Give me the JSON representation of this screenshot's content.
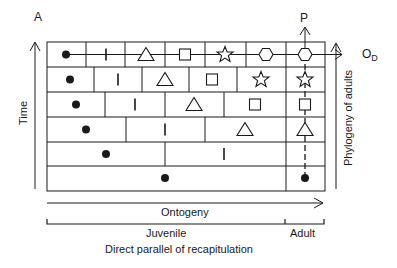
{
  "diagram": {
    "title": "Direct parallel of recapitulation",
    "labels": {
      "corner": "A",
      "time_axis": "Time",
      "phylogeny_axis": "Phylogeny of adults",
      "phylogeny_top": "P",
      "descendant_ontogeny": "O",
      "descendant_subscript": "D",
      "ontogeny_axis": "Ontogeny",
      "juvenile": "Juvenile",
      "adult": "Adult",
      "caption": "Direct parallel of recapitulation"
    },
    "colors": {
      "line": "#1a1a1a",
      "background": "#ffffff"
    },
    "rows": [
      {
        "index": 1,
        "stages": [
          "dot",
          "bar",
          "triangle",
          "square",
          "star",
          "hexagon",
          "hexagon"
        ],
        "note": "descendant ontogeny (top)"
      },
      {
        "index": 2,
        "stages": [
          "dot",
          "bar",
          "triangle",
          "square",
          "star",
          "star"
        ]
      },
      {
        "index": 3,
        "stages": [
          "dot",
          "bar",
          "triangle",
          "square",
          "square"
        ]
      },
      {
        "index": 4,
        "stages": [
          "dot",
          "bar",
          "triangle",
          "triangle"
        ]
      },
      {
        "index": 5,
        "stages": [
          "dot",
          "bar",
          "bar"
        ]
      },
      {
        "index": 6,
        "stages": [
          "dot",
          "dot"
        ],
        "note": "ancestral ontogeny (bottom)"
      }
    ],
    "symbols": {
      "dot": "filled-circle",
      "bar": "vertical-bar",
      "triangle": "open-triangle",
      "square": "open-square",
      "star": "open-star",
      "hexagon": "open-hexagon"
    }
  }
}
